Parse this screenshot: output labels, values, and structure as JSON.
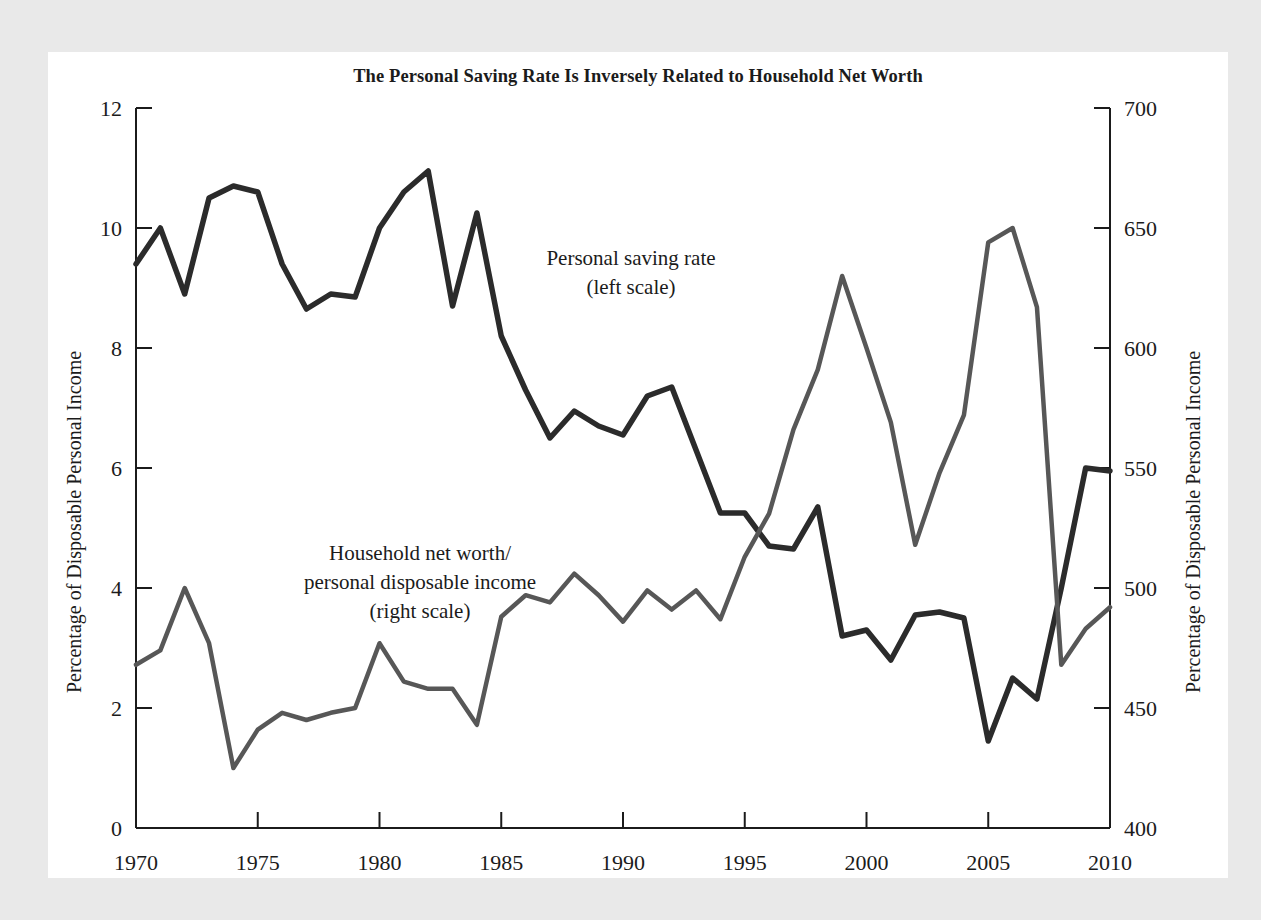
{
  "chart_card": {
    "background": "#ffffff",
    "page_background": "#e9e9e9"
  },
  "chart_data": {
    "type": "line",
    "title": "The Personal Saving Rate Is Inversely Related to Household Net Worth",
    "xlabel": "",
    "ylabel": "Percentage of Disposable Personal Income",
    "y2label": "Percentage of Disposable Personal Income",
    "xlim": [
      1970,
      2010
    ],
    "ylim": [
      0,
      12
    ],
    "y2lim": [
      400,
      700
    ],
    "xticks": [
      1970,
      1975,
      1980,
      1985,
      1990,
      1995,
      2000,
      2005,
      2010
    ],
    "xtick_labels": [
      "1970",
      "1975",
      "1980",
      "1985",
      "1990",
      "1995",
      "2000",
      "2005",
      "2010"
    ],
    "yticks": [
      0,
      2,
      4,
      6,
      8,
      10,
      12
    ],
    "ytick_labels": [
      "0",
      "2",
      "4",
      "6",
      "8",
      "10",
      "12"
    ],
    "y2ticks": [
      400,
      450,
      500,
      550,
      600,
      650,
      700
    ],
    "y2tick_labels": [
      "400",
      "450",
      "500",
      "550",
      "600",
      "650",
      "700"
    ],
    "grid": false,
    "legend": "annotations-inline",
    "x": [
      1970,
      1971,
      1972,
      1973,
      1974,
      1975,
      1976,
      1977,
      1978,
      1979,
      1980,
      1981,
      1982,
      1983,
      1984,
      1985,
      1986,
      1987,
      1988,
      1989,
      1990,
      1991,
      1992,
      1993,
      1994,
      1995,
      1996,
      1997,
      1998,
      1999,
      2000,
      2001,
      2002,
      2003,
      2004,
      2005,
      2006,
      2007,
      2008,
      2009,
      2010
    ],
    "series": [
      {
        "name": "Personal saving rate",
        "axis": "left",
        "color": "#2b2b2b",
        "annotation": "Personal saving rate\n(left scale)",
        "annotation_line1": "Personal saving rate",
        "annotation_line2": "(left scale)",
        "values": [
          9.4,
          10.0,
          8.9,
          10.5,
          10.7,
          10.6,
          9.4,
          8.65,
          8.9,
          8.85,
          10.0,
          10.6,
          10.95,
          8.7,
          10.25,
          8.2,
          7.3,
          6.5,
          6.95,
          6.7,
          6.55,
          7.2,
          7.35,
          6.3,
          5.25,
          5.25,
          4.7,
          4.65,
          5.35,
          3.2,
          3.3,
          2.8,
          3.55,
          3.6,
          3.5,
          1.45,
          2.5,
          2.15,
          4.0,
          6.0,
          5.95
        ]
      },
      {
        "name": "Household net worth/personal disposable income",
        "axis": "right",
        "color": "#575757",
        "annotation": "Household net worth/\npersonal disposable income\n(right scale)",
        "annotation_line1": "Household net worth/",
        "annotation_line2": "personal disposable income",
        "annotation_line3": "(right scale)",
        "values": [
          468,
          474,
          500,
          477,
          425,
          441,
          448,
          445,
          448,
          450,
          477,
          461,
          458,
          458,
          443,
          488,
          497,
          494,
          506,
          497,
          486,
          499,
          491,
          499,
          487,
          513,
          531,
          566,
          591,
          630,
          600,
          569,
          518,
          548,
          572,
          644,
          650,
          617,
          468,
          483,
          492
        ]
      }
    ]
  },
  "axes": {
    "left_title": "Percentage of Disposable Personal Income",
    "right_title": "Percentage of Disposable Personal Income"
  }
}
